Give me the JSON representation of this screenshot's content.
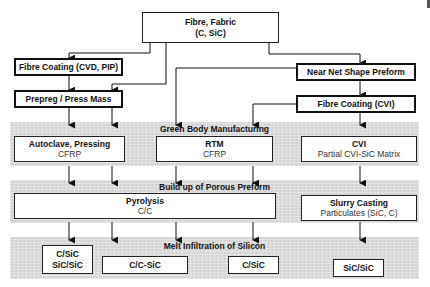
{
  "diagram": {
    "top": {
      "line1": "Fibre, Fabric",
      "line2": "(C, SiC)"
    },
    "left_branch": {
      "fibre_coating": "Fibre Coating (CVD, PIP)",
      "prepreg": "Prepreg / Press Mass"
    },
    "right_branch": {
      "near_net": "Near Net Shape Preform",
      "fibre_coating_cvi": "Fibre Coating (CVI)"
    },
    "stages": [
      {
        "title": "Green Body Manufacturing",
        "boxes": [
          {
            "title": "Autoclave, Pressing",
            "subtitle": "CFRP"
          },
          {
            "title": "RTM",
            "subtitle": "CFRP"
          },
          {
            "title": "CVI",
            "subtitle": "Partial CVI-SiC Matrix"
          }
        ]
      },
      {
        "title": "Build up of Porous Preform",
        "boxes": [
          {
            "title": "Pyrolysis",
            "subtitle": "C/C"
          },
          {
            "title": "Slurry Casting",
            "subtitle": "Particulates (SiC, C)"
          }
        ]
      },
      {
        "title": "Melt Infiltration of Silicon",
        "boxes": [
          {
            "line1": "C/SiC",
            "line2": "SiC/SiC"
          },
          {
            "line1": "C/C-SiC"
          },
          {
            "line1": "C/SiC"
          },
          {
            "line1": "SiC/SiC"
          }
        ]
      }
    ],
    "colors": {
      "band_fill": "#d4d4d4",
      "box_border": "#111111",
      "arrow": "#111111"
    }
  }
}
